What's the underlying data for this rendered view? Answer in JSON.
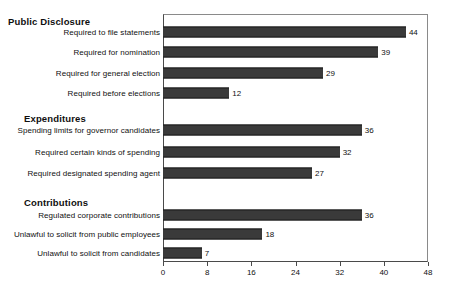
{
  "chart_data": {
    "type": "bar",
    "orientation": "horizontal",
    "title": "",
    "xlabel": "",
    "ylabel": "",
    "xlim": [
      0,
      48
    ],
    "xticks": [
      0,
      8,
      16,
      24,
      32,
      40,
      48
    ],
    "grid": false,
    "legend": false,
    "bar_color": "#3a3a3a",
    "value_labels": true,
    "groups": [
      {
        "heading": "Public Disclosure",
        "items": [
          {
            "label": "Required to file statements",
            "value": 44
          },
          {
            "label": "Required for nomination",
            "value": 39
          },
          {
            "label": "Required for general election",
            "value": 29
          },
          {
            "label": "Required before elections",
            "value": 12
          }
        ]
      },
      {
        "heading": "Expenditures",
        "items": [
          {
            "label": "Spending limits for governor candidates",
            "value": 36
          },
          {
            "label": "Required certain kinds of spending",
            "value": 32
          },
          {
            "label": "Required designated spending agent",
            "value": 27
          }
        ]
      },
      {
        "heading": "Contributions",
        "items": [
          {
            "label": "Regulated corporate contributions",
            "value": 36
          },
          {
            "label": "Unlawful to solicit from public employees",
            "value": 18
          },
          {
            "label": "Unlawful to solicit from candidates",
            "value": 7
          }
        ]
      }
    ],
    "categories": [
      "Required to file statements",
      "Required for nomination",
      "Required for general election",
      "Required before elections",
      "Spending limits for governor candidates",
      "Required certain kinds of spending",
      "Required designated spending agent",
      "Regulated corporate contributions",
      "Unlawful to solicit from public employees",
      "Unlawful to solicit from candidates"
    ],
    "values": [
      44,
      39,
      29,
      12,
      36,
      32,
      27,
      36,
      18,
      7
    ]
  }
}
